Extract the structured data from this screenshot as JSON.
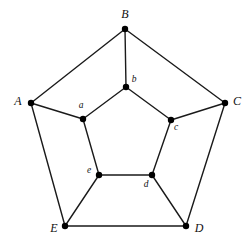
{
  "figure": {
    "background_color": "#ffffff",
    "edge_color": "#1a1a1a",
    "vertex_color": "#000000",
    "edge_width": 1.4,
    "vertex_radius": 3.2,
    "width": 251,
    "height": 246
  },
  "chart_data": {
    "type": "diagram",
    "subtype": "graph",
    "title": "",
    "nodes": [
      {
        "id": "A",
        "label": "A",
        "x": 31,
        "y": 103,
        "class": "outer",
        "label_x": 18,
        "label_y": 101
      },
      {
        "id": "B",
        "label": "B",
        "x": 125,
        "y": 29,
        "class": "outer",
        "label_x": 125,
        "label_y": 14
      },
      {
        "id": "C",
        "label": "C",
        "x": 225,
        "y": 103,
        "class": "outer",
        "label_x": 237,
        "label_y": 101
      },
      {
        "id": "D",
        "label": "D",
        "x": 186,
        "y": 226,
        "class": "outer",
        "label_x": 199,
        "label_y": 228
      },
      {
        "id": "E",
        "label": "E",
        "x": 65,
        "y": 226,
        "class": "outer",
        "label_x": 54,
        "label_y": 228
      },
      {
        "id": "a",
        "label": "a",
        "x": 83,
        "y": 119,
        "class": "inner",
        "label_x": 81,
        "label_y": 106
      },
      {
        "id": "b",
        "label": "b",
        "x": 126,
        "y": 87,
        "class": "inner",
        "label_x": 134,
        "label_y": 80
      },
      {
        "id": "c",
        "label": "c",
        "x": 171,
        "y": 120,
        "class": "inner",
        "label_x": 176,
        "label_y": 128
      },
      {
        "id": "d",
        "label": "d",
        "x": 152,
        "y": 175,
        "class": "inner",
        "label_x": 146,
        "label_y": 185
      },
      {
        "id": "e",
        "label": "e",
        "x": 99,
        "y": 175,
        "class": "inner",
        "label_x": 89,
        "label_y": 171
      }
    ],
    "edges": [
      {
        "from": "A",
        "to": "B",
        "kind": "outer-cycle"
      },
      {
        "from": "B",
        "to": "C",
        "kind": "outer-cycle"
      },
      {
        "from": "C",
        "to": "D",
        "kind": "outer-cycle"
      },
      {
        "from": "D",
        "to": "E",
        "kind": "outer-cycle"
      },
      {
        "from": "E",
        "to": "A",
        "kind": "outer-cycle"
      },
      {
        "from": "a",
        "to": "b",
        "kind": "inner-cycle"
      },
      {
        "from": "b",
        "to": "c",
        "kind": "inner-cycle"
      },
      {
        "from": "c",
        "to": "d",
        "kind": "inner-cycle"
      },
      {
        "from": "d",
        "to": "e",
        "kind": "inner-cycle"
      },
      {
        "from": "e",
        "to": "a",
        "kind": "inner-cycle"
      },
      {
        "from": "A",
        "to": "a",
        "kind": "spoke"
      },
      {
        "from": "B",
        "to": "b",
        "kind": "spoke"
      },
      {
        "from": "C",
        "to": "c",
        "kind": "spoke"
      },
      {
        "from": "D",
        "to": "d",
        "kind": "spoke"
      },
      {
        "from": "E",
        "to": "e",
        "kind": "spoke"
      }
    ]
  }
}
